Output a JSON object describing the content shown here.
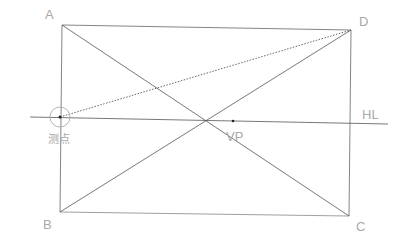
{
  "diagram": {
    "type": "perspective-construction",
    "labels": {
      "A": "A",
      "B": "B",
      "C": "C",
      "D": "D",
      "horizon_line": "HL",
      "vanishing_point": "VP",
      "measuring_point": "测点"
    },
    "points": {
      "A": [
        62,
        25
      ],
      "B": [
        60,
        212
      ],
      "C": [
        349,
        216
      ],
      "D": [
        351,
        30
      ],
      "VP": [
        233,
        121
      ],
      "measuring_point": [
        60,
        117
      ]
    },
    "colors": {
      "line": "#555555",
      "label": "#a8a8a8",
      "background": "#ffffff"
    }
  }
}
